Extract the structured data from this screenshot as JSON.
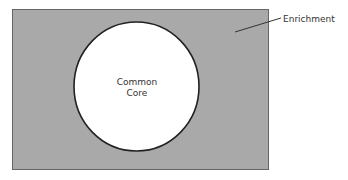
{
  "diagram": {
    "type": "nested-region",
    "outer_region": {
      "label": "Enrichment",
      "fill": "#a9a9a9",
      "stroke": "#555555"
    },
    "inner_region": {
      "label_line1": "Common",
      "label_line2": "Core",
      "fill": "#ffffff",
      "stroke": "#222222"
    },
    "leader_line_color": "#333333"
  }
}
